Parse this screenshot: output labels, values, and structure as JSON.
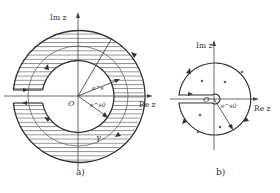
{
  "figure_a": {
    "axis_im_label": "Im z",
    "axis_re_label": "Re z",
    "origin_label": "O",
    "radius_outer_label": "e^s",
    "radius_inner_label": "e^s0",
    "contour_label": "γ",
    "caption": "a)"
  },
  "figure_b": {
    "axis_im_label": "Im z",
    "axis_re_label": "Re z",
    "origin_label": "O",
    "radius_label": "e^s0",
    "caption": "b)"
  },
  "colors": {
    "line": "#333333",
    "hatch": "#555555",
    "background": "#ffffff"
  }
}
